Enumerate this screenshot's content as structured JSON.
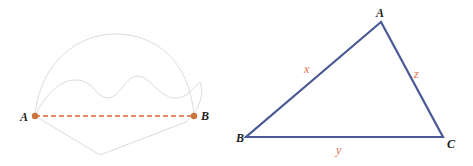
{
  "colors": {
    "path_gray": "#dcdcdc",
    "segment_red": "#e0603a",
    "point_orange": "#c8743a",
    "triangle_blue": "#4a5a96",
    "side_label_red": "#e07050",
    "point_label": "#222222"
  },
  "left_figure": {
    "points": [
      {
        "label": "A",
        "x": 35,
        "y": 116
      },
      {
        "label": "B",
        "x": 194,
        "y": 116
      }
    ],
    "segment": {
      "from": "A",
      "to": "B",
      "style": "dashed"
    },
    "curves": [
      "arc-path",
      "wavy-path",
      "lower-broken-path"
    ]
  },
  "right_figure": {
    "vertices": [
      {
        "label": "A",
        "x": 381,
        "y": 22
      },
      {
        "label": "B",
        "x": 246,
        "y": 137
      },
      {
        "label": "C",
        "x": 443,
        "y": 137
      }
    ],
    "sides": [
      {
        "label": "x",
        "between": "A-B"
      },
      {
        "label": "y",
        "between": "B-C"
      },
      {
        "label": "z",
        "between": "A-C"
      }
    ]
  }
}
